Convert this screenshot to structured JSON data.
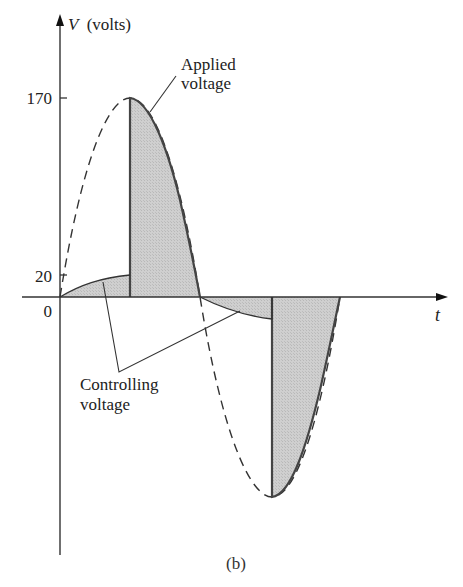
{
  "figure": {
    "caption": "(b)",
    "y_axis_label": "V (volts)",
    "y_axis_var": "V",
    "y_axis_unit": "(volts)",
    "x_axis_label": "t",
    "ticks": {
      "peak": "170",
      "low": "20",
      "origin": "0"
    },
    "annotations": {
      "applied_line1": "Applied",
      "applied_line2": "voltage",
      "controlling_line1": "Controlling",
      "controlling_line2": "voltage"
    }
  },
  "colors": {
    "shade": "#c8c8c8",
    "stroke": "#444444",
    "axis": "#333333"
  }
}
